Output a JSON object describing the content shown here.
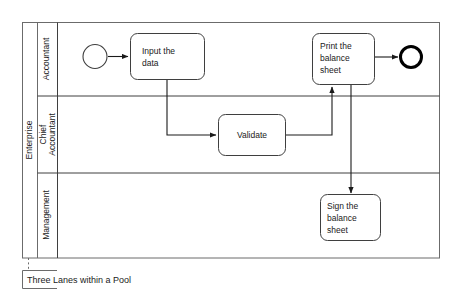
{
  "diagram": {
    "type": "bpmn-pool-with-lanes",
    "caption": "Three Lanes within a Pool",
    "pool": {
      "label": "Enterprise"
    },
    "lanes": [
      {
        "id": "accountant",
        "label": "Accountant"
      },
      {
        "id": "chief-accountant",
        "label_line1": "Chief",
        "label_line2": "Accountant",
        "label": "Chief Accountant"
      },
      {
        "id": "management",
        "label": "Management"
      }
    ],
    "events": [
      {
        "id": "start-event",
        "kind": "start",
        "lane": "accountant"
      },
      {
        "id": "end-event",
        "kind": "end",
        "lane": "accountant"
      }
    ],
    "tasks": [
      {
        "id": "input-the-data",
        "lane": "accountant",
        "line1": "Input the",
        "line2": "data",
        "line3": "",
        "label": "Input the data"
      },
      {
        "id": "validate",
        "lane": "chief-accountant",
        "line1": "Validate",
        "line2": "",
        "line3": "",
        "label": "Validate"
      },
      {
        "id": "print-the-balance-sheet",
        "lane": "accountant",
        "line1": "Print the",
        "line2": "balance",
        "line3": "sheet",
        "label": "Print the balance sheet"
      },
      {
        "id": "sign-the-balance-sheet",
        "lane": "management",
        "line1": "Sign the",
        "line2": "balance",
        "line3": "sheet",
        "label": "Sign the balance sheet"
      }
    ],
    "flows": [
      {
        "id": "flow-start-to-input",
        "from": "start-event",
        "to": "input-the-data"
      },
      {
        "id": "flow-input-to-validate",
        "from": "input-the-data",
        "to": "validate"
      },
      {
        "id": "flow-validate-to-print",
        "from": "validate",
        "to": "print-the-balance-sheet"
      },
      {
        "id": "flow-print-to-end",
        "from": "print-the-balance-sheet",
        "to": "end-event"
      },
      {
        "id": "flow-print-to-sign",
        "from": "print-the-balance-sheet",
        "to": "sign-the-balance-sheet"
      }
    ],
    "colors": {
      "stroke": "#3f3f3f",
      "pool_stroke": "#6b6b6b",
      "flow_stroke": "#1a1a1a",
      "background": "#ffffff",
      "text": "#1a1a1a"
    }
  }
}
